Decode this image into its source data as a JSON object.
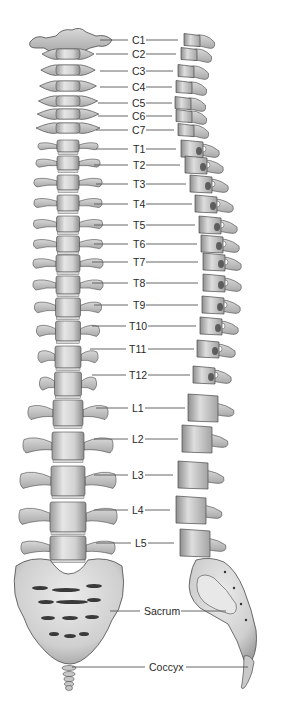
{
  "diagram": {
    "views": [
      "anterior",
      "lateral"
    ],
    "colors": {
      "bone_light": "#e4e4e4",
      "bone_mid": "#bdbdbd",
      "bone_dark": "#8a8a8a",
      "outline": "#4a4a4a",
      "leader": "#555555",
      "text": "#2a2a2a"
    },
    "labels": [
      {
        "id": "C1",
        "text": "C1",
        "y": 40,
        "x": 131,
        "line_left": [
          100,
          128
        ],
        "line_right": [
          146,
          178
        ]
      },
      {
        "id": "C2",
        "text": "C2",
        "y": 54,
        "x": 131,
        "line_left": [
          96,
          128
        ],
        "line_right": [
          146,
          176
        ]
      },
      {
        "id": "C3",
        "text": "C3",
        "y": 71,
        "x": 131,
        "line_left": [
          100,
          128
        ],
        "line_right": [
          146,
          173
        ]
      },
      {
        "id": "C4",
        "text": "C4",
        "y": 87,
        "x": 131,
        "line_left": [
          100,
          128
        ],
        "line_right": [
          146,
          172
        ]
      },
      {
        "id": "C5",
        "text": "C5",
        "y": 103,
        "x": 131,
        "line_left": [
          98,
          128
        ],
        "line_right": [
          146,
          172
        ]
      },
      {
        "id": "C6",
        "text": "C6",
        "y": 116,
        "x": 131,
        "line_left": [
          98,
          128
        ],
        "line_right": [
          146,
          172
        ]
      },
      {
        "id": "C7",
        "text": "C7",
        "y": 130,
        "x": 131,
        "line_left": [
          96,
          128
        ],
        "line_right": [
          146,
          174
        ]
      },
      {
        "id": "T1",
        "text": "T1",
        "y": 149,
        "x": 132,
        "line_left": [
          96,
          128
        ],
        "line_right": [
          146,
          176
        ]
      },
      {
        "id": "T2",
        "text": "T2",
        "y": 165,
        "x": 132,
        "line_left": [
          94,
          128
        ],
        "line_right": [
          146,
          180
        ]
      },
      {
        "id": "T3",
        "text": "T3",
        "y": 184,
        "x": 132,
        "line_left": [
          96,
          128
        ],
        "line_right": [
          146,
          186
        ]
      },
      {
        "id": "T4",
        "text": "T4",
        "y": 204,
        "x": 132,
        "line_left": [
          94,
          128
        ],
        "line_right": [
          146,
          192
        ]
      },
      {
        "id": "T5",
        "text": "T5",
        "y": 225,
        "x": 132,
        "line_left": [
          94,
          128
        ],
        "line_right": [
          146,
          195
        ]
      },
      {
        "id": "T6",
        "text": "T6",
        "y": 244,
        "x": 132,
        "line_left": [
          94,
          128
        ],
        "line_right": [
          146,
          197
        ]
      },
      {
        "id": "T7",
        "text": "T7",
        "y": 262,
        "x": 132,
        "line_left": [
          92,
          128
        ],
        "line_right": [
          146,
          198
        ]
      },
      {
        "id": "T8",
        "text": "T8",
        "y": 283,
        "x": 132,
        "line_left": [
          92,
          128
        ],
        "line_right": [
          146,
          198
        ]
      },
      {
        "id": "T9",
        "text": "T9",
        "y": 305,
        "x": 132,
        "line_left": [
          94,
          128
        ],
        "line_right": [
          146,
          198
        ]
      },
      {
        "id": "T10",
        "text": "T10",
        "y": 326,
        "x": 128,
        "line_left": [
          92,
          126
        ],
        "line_right": [
          148,
          196
        ]
      },
      {
        "id": "T11",
        "text": "T11",
        "y": 349,
        "x": 128,
        "line_left": [
          90,
          126
        ],
        "line_right": [
          148,
          194
        ]
      },
      {
        "id": "T12",
        "text": "T12",
        "y": 375,
        "x": 128,
        "line_left": [
          92,
          126
        ],
        "line_right": [
          148,
          190
        ]
      },
      {
        "id": "L1",
        "text": "L1",
        "y": 408,
        "x": 131,
        "line_left": [
          96,
          128
        ],
        "line_right": [
          144,
          185
        ]
      },
      {
        "id": "L2",
        "text": "L2",
        "y": 439,
        "x": 131,
        "line_left": [
          94,
          128
        ],
        "line_right": [
          144,
          178
        ]
      },
      {
        "id": "L3",
        "text": "L3",
        "y": 475,
        "x": 131,
        "line_left": [
          94,
          128
        ],
        "line_right": [
          144,
          173
        ]
      },
      {
        "id": "L4",
        "text": "L4",
        "y": 510,
        "x": 131,
        "line_left": [
          94,
          128
        ],
        "line_right": [
          144,
          170
        ]
      },
      {
        "id": "L5",
        "text": "L5",
        "y": 543,
        "x": 134,
        "line_left": [
          96,
          131
        ],
        "line_right": [
          146,
          174
        ]
      },
      {
        "id": "Sacrum",
        "text": "Sacrum",
        "y": 611,
        "x": 143,
        "line_left": [
          110,
          140
        ],
        "line_right": [
          180,
          226
        ]
      },
      {
        "id": "Coccyx",
        "text": "Coccyx",
        "y": 667,
        "x": 148,
        "line_left": [
          72,
          145
        ],
        "line_right": [
          186,
          248
        ]
      }
    ]
  }
}
